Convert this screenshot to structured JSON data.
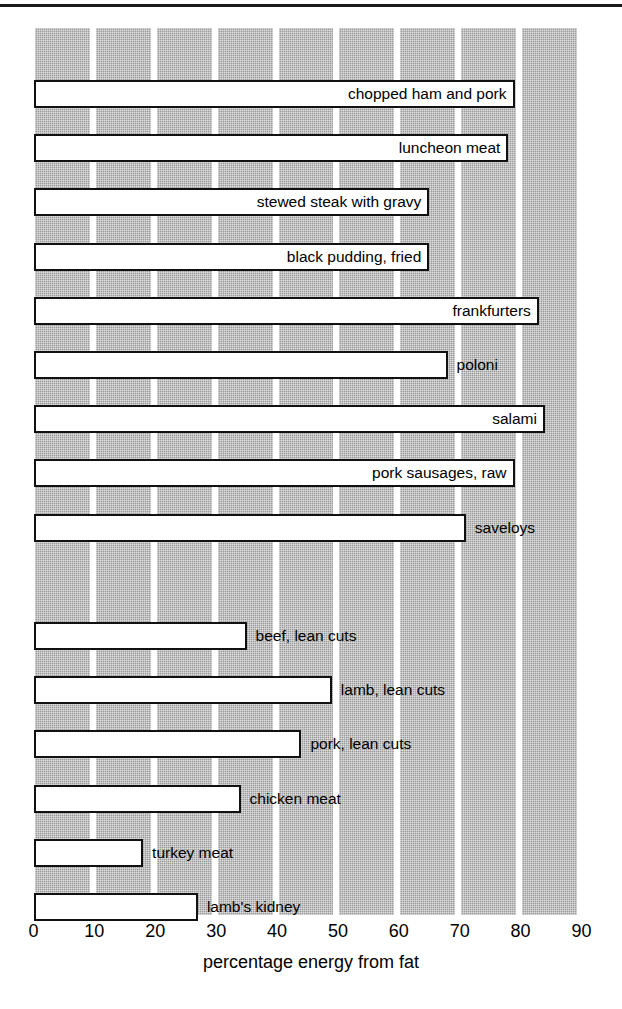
{
  "chart_data": {
    "type": "bar",
    "orientation": "horizontal",
    "title": "",
    "xlabel": "percentage energy from fat",
    "ylabel": "",
    "xlim": [
      0,
      90
    ],
    "xticks": [
      0,
      10,
      20,
      30,
      40,
      50,
      60,
      70,
      80,
      90
    ],
    "xtick_labels": [
      "0",
      "10",
      "20",
      "30",
      "40",
      "50",
      "60",
      "70",
      "80",
      "90"
    ],
    "grid": "vertical shaded bands between gridlines",
    "legend": "none",
    "categories": [
      "chopped ham and pork",
      "luncheon meat",
      "stewed steak with gravy",
      "black pudding, fried",
      "frankfurters",
      "poloni",
      "salami",
      "pork sausages, raw",
      "saveloys",
      "beef, lean cuts",
      "lamb, lean cuts",
      "pork, lean cuts",
      "chicken meat",
      "turkey meat",
      "lamb's kidney"
    ],
    "values": [
      79,
      78,
      65,
      65,
      83,
      68,
      84,
      79,
      71,
      35,
      49,
      44,
      34,
      18,
      27
    ],
    "groups": [
      {
        "name": "processed meats",
        "items": [
          {
            "label": "chopped ham and pork",
            "value": 79,
            "label_position": "inside"
          },
          {
            "label": "luncheon meat",
            "value": 78,
            "label_position": "inside"
          },
          {
            "label": "stewed steak with gravy",
            "value": 65,
            "label_position": "inside"
          },
          {
            "label": "black pudding, fried",
            "value": 65,
            "label_position": "inside"
          },
          {
            "label": "frankfurters",
            "value": 83,
            "label_position": "inside"
          },
          {
            "label": "poloni",
            "value": 68,
            "label_position": "outside"
          },
          {
            "label": "salami",
            "value": 84,
            "label_position": "inside"
          },
          {
            "label": "pork sausages, raw",
            "value": 79,
            "label_position": "inside"
          },
          {
            "label": "saveloys",
            "value": 71,
            "label_position": "outside"
          }
        ]
      },
      {
        "name": "lean meats",
        "items": [
          {
            "label": "beef, lean cuts",
            "value": 35,
            "label_position": "outside"
          },
          {
            "label": "lamb, lean cuts",
            "value": 49,
            "label_position": "outside"
          },
          {
            "label": "pork, lean cuts",
            "value": 44,
            "label_position": "outside"
          },
          {
            "label": "chicken meat",
            "value": 34,
            "label_position": "outside"
          },
          {
            "label": "turkey meat",
            "value": 18,
            "label_position": "outside"
          },
          {
            "label": "lamb's kidney",
            "value": 27,
            "label_position": "outside"
          }
        ]
      }
    ],
    "colors": {
      "bar_fill": "#ffffff",
      "bar_edge": "#111111",
      "band": "#9a9a9a",
      "background": "#ffffff",
      "text": "#000000",
      "rule": "#1a1a1a"
    }
  }
}
